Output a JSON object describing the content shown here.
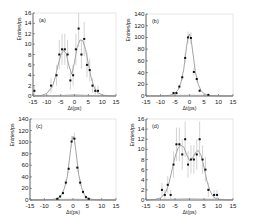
{
  "figure": {
    "panel_count": 4,
    "colors": {
      "axis": "#333333",
      "points": "#111111",
      "fit": "#8a8a8a",
      "errorbar": "#b5b5b5",
      "background_curve": "#9a9a9a"
    }
  },
  "chart_data": [
    {
      "id": "a",
      "type": "scatter",
      "label": "(a)",
      "xlabel": "Δt(ps)",
      "ylabel": "Entries/ps",
      "xlim": [
        -15,
        15
      ],
      "ylim": [
        0,
        16
      ],
      "xticks": [
        -15,
        -10,
        -5,
        0,
        5,
        10,
        15
      ],
      "yticks": [
        0,
        2,
        4,
        6,
        8,
        10,
        12,
        14,
        16
      ],
      "grid": false,
      "frame_px": {
        "left": 33,
        "top": 13,
        "right": 116,
        "bottom": 96
      },
      "points": [
        {
          "x": -14.5,
          "y": 1,
          "err": 1
        },
        {
          "x": -8.5,
          "y": 2,
          "err": 1.4
        },
        {
          "x": -6.5,
          "y": 4,
          "err": 2
        },
        {
          "x": -5.5,
          "y": 8,
          "err": 2.8
        },
        {
          "x": -4.5,
          "y": 9,
          "err": 3
        },
        {
          "x": -3.5,
          "y": 9,
          "err": 3
        },
        {
          "x": -2.5,
          "y": 8,
          "err": 2.8
        },
        {
          "x": -1.5,
          "y": 3,
          "err": 1.7
        },
        {
          "x": -0.5,
          "y": 4,
          "err": 2
        },
        {
          "x": 0.5,
          "y": 9,
          "err": 3
        },
        {
          "x": 1.5,
          "y": 13,
          "err": 3.6
        },
        {
          "x": 2.5,
          "y": 8,
          "err": 2.8
        },
        {
          "x": 3.5,
          "y": 11,
          "err": 3.3
        },
        {
          "x": 4.5,
          "y": 6,
          "err": 2.4
        },
        {
          "x": 5.5,
          "y": 5,
          "err": 2.2
        },
        {
          "x": 6.5,
          "y": 2,
          "err": 1.4
        },
        {
          "x": 7.5,
          "y": 1,
          "err": 1
        },
        {
          "x": 8.5,
          "y": 1,
          "err": 1
        }
      ],
      "fit": {
        "x": [
          -15,
          -12,
          -10,
          -8,
          -7,
          -6,
          -5,
          -4,
          -3,
          -2,
          -1,
          0,
          1,
          2,
          3,
          4,
          5,
          6,
          7,
          8,
          10,
          12,
          15
        ],
        "y": [
          0,
          0.1,
          0.5,
          1.8,
          3.5,
          5.8,
          7.8,
          8.8,
          8.2,
          5.8,
          4.2,
          6.5,
          9.5,
          10.8,
          10.7,
          9.0,
          6.2,
          3.6,
          1.8,
          0.8,
          0.2,
          0.05,
          0
        ]
      },
      "background": {
        "x": [
          -15,
          -5,
          0,
          5,
          15
        ],
        "y": [
          0.05,
          0.1,
          0.3,
          0.1,
          0.05
        ]
      }
    },
    {
      "id": "b",
      "type": "scatter",
      "label": "(b)",
      "xlabel": "Δt(ps)",
      "ylabel": "Entries/ps",
      "xlim": [
        -15,
        15
      ],
      "ylim": [
        0,
        140
      ],
      "xticks": [
        -15,
        -10,
        -5,
        0,
        5,
        10,
        15
      ],
      "yticks": [
        0,
        20,
        40,
        60,
        80,
        100,
        120,
        140
      ],
      "grid": false,
      "frame_px": {
        "left": 146,
        "top": 14,
        "right": 233,
        "bottom": 96
      },
      "points": [
        {
          "x": -5.5,
          "y": 5,
          "err": 2.2
        },
        {
          "x": -4.5,
          "y": 5,
          "err": 2.2
        },
        {
          "x": -3.5,
          "y": 16,
          "err": 4
        },
        {
          "x": -2.5,
          "y": 32,
          "err": 5.7
        },
        {
          "x": -1.5,
          "y": 65,
          "err": 8
        },
        {
          "x": -0.5,
          "y": 100,
          "err": 10
        },
        {
          "x": 0.5,
          "y": 99,
          "err": 10
        },
        {
          "x": 1.5,
          "y": 41,
          "err": 6.4
        },
        {
          "x": 2.5,
          "y": 29,
          "err": 5.4
        },
        {
          "x": 3.5,
          "y": 9,
          "err": 3
        },
        {
          "x": 6.5,
          "y": 2,
          "err": 1.4
        }
      ],
      "fit": {
        "x": [
          -15,
          -10,
          -7,
          -6,
          -5,
          -4,
          -3,
          -2,
          -1,
          -0.5,
          0,
          0.5,
          1,
          2,
          3,
          4,
          5,
          6,
          7,
          10,
          15
        ],
        "y": [
          0,
          0.2,
          1,
          2.5,
          5,
          10,
          22,
          45,
          85,
          100,
          106,
          98,
          80,
          42,
          20,
          9,
          4,
          2,
          0.8,
          0.1,
          0
        ]
      },
      "background": {
        "x": [
          -15,
          0,
          15
        ],
        "y": [
          0.3,
          1.5,
          0.3
        ]
      }
    },
    {
      "id": "c",
      "type": "scatter",
      "label": "(c)",
      "xlabel": "Δt(ps)",
      "ylabel": "Entries/ps",
      "xlim": [
        -15,
        15
      ],
      "ylim": [
        0,
        140
      ],
      "xticks": [
        -15,
        -10,
        -5,
        0,
        5,
        10,
        15
      ],
      "yticks": [
        0,
        20,
        40,
        60,
        80,
        100,
        120,
        140
      ],
      "grid": false,
      "frame_px": {
        "left": 30,
        "top": 119,
        "right": 116,
        "bottom": 200
      },
      "points": [
        {
          "x": -5.5,
          "y": 2,
          "err": 1.4
        },
        {
          "x": -4.5,
          "y": 6,
          "err": 2.4
        },
        {
          "x": -3.5,
          "y": 12,
          "err": 3.5
        },
        {
          "x": -2.5,
          "y": 30,
          "err": 5.5
        },
        {
          "x": -1.5,
          "y": 54,
          "err": 7.3
        },
        {
          "x": -0.5,
          "y": 101,
          "err": 10
        },
        {
          "x": 0.5,
          "y": 106,
          "err": 10.3
        },
        {
          "x": 1.5,
          "y": 56,
          "err": 7.5
        },
        {
          "x": 2.5,
          "y": 30,
          "err": 5.5
        },
        {
          "x": 3.5,
          "y": 14,
          "err": 3.7
        },
        {
          "x": 4.5,
          "y": 5,
          "err": 2.2
        },
        {
          "x": 5.5,
          "y": 2,
          "err": 1.4
        }
      ],
      "fit": {
        "x": [
          -15,
          -10,
          -7,
          -6,
          -5,
          -4,
          -3,
          -2,
          -1,
          -0.5,
          0,
          0.5,
          1,
          2,
          3,
          4,
          5,
          6,
          7,
          10,
          15
        ],
        "y": [
          0,
          0.2,
          1,
          2,
          4,
          9,
          20,
          40,
          80,
          100,
          110,
          104,
          85,
          44,
          21,
          9,
          4,
          2,
          0.8,
          0.1,
          0
        ]
      },
      "background": {
        "x": [
          -15,
          0,
          15
        ],
        "y": [
          0.3,
          1.5,
          0.3
        ]
      }
    },
    {
      "id": "d",
      "type": "scatter",
      "label": "(d)",
      "xlabel": "Δt(ps)",
      "ylabel": "Entries/ps",
      "xlim": [
        -15,
        15
      ],
      "ylim": [
        0,
        16
      ],
      "xticks": [
        -15,
        -10,
        -5,
        0,
        5,
        10,
        15
      ],
      "yticks": [
        0,
        2,
        4,
        6,
        8,
        10,
        12,
        14,
        16
      ],
      "grid": false,
      "frame_px": {
        "left": 146,
        "top": 119,
        "right": 233,
        "bottom": 200
      },
      "points": [
        {
          "x": -9.5,
          "y": 2,
          "err": 1.4
        },
        {
          "x": -8.5,
          "y": 1,
          "err": 1
        },
        {
          "x": -7.5,
          "y": 3,
          "err": 1.7
        },
        {
          "x": -6.5,
          "y": 1,
          "err": 1
        },
        {
          "x": -5.5,
          "y": 7,
          "err": 2.6
        },
        {
          "x": -4.5,
          "y": 11,
          "err": 3.3
        },
        {
          "x": -3.5,
          "y": 11,
          "err": 3.3
        },
        {
          "x": -2.5,
          "y": 9,
          "err": 3
        },
        {
          "x": -1.5,
          "y": 12,
          "err": 3.5
        },
        {
          "x": -0.5,
          "y": 7,
          "err": 2.6
        },
        {
          "x": 0.5,
          "y": 8,
          "err": 2.8
        },
        {
          "x": 1.5,
          "y": 8,
          "err": 2.8
        },
        {
          "x": 2.5,
          "y": 9,
          "err": 3
        },
        {
          "x": 3.5,
          "y": 12,
          "err": 3.5
        },
        {
          "x": 4.5,
          "y": 8,
          "err": 2.8
        },
        {
          "x": 5.5,
          "y": 6,
          "err": 2.4
        },
        {
          "x": 6.5,
          "y": 2,
          "err": 1.4
        },
        {
          "x": 8.5,
          "y": 1,
          "err": 1
        },
        {
          "x": 9.5,
          "y": 1,
          "err": 1
        }
      ],
      "fit": {
        "x": [
          -15,
          -12,
          -10,
          -9,
          -8,
          -7,
          -6,
          -5,
          -4,
          -3,
          -2,
          -1,
          0,
          1,
          2,
          3,
          4,
          5,
          6,
          7,
          8,
          9,
          10,
          12,
          15
        ],
        "y": [
          0,
          0.1,
          0.4,
          0.9,
          1.8,
          3.5,
          6,
          8.5,
          10.2,
          10.8,
          10.5,
          9,
          7.8,
          8.2,
          9.3,
          9.8,
          8.8,
          6.5,
          3.8,
          1.9,
          0.8,
          0.3,
          0.15,
          0.05,
          0
        ]
      },
      "background": {
        "x": [
          -15,
          0,
          15
        ],
        "y": [
          0.05,
          0.3,
          0.05
        ]
      }
    }
  ]
}
